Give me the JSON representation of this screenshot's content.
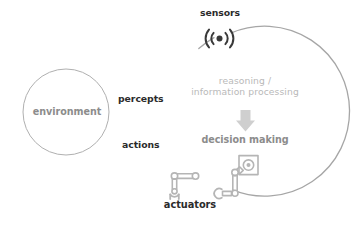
{
  "diagram": {
    "background_color": "#ffffff",
    "labels": {
      "environment": "environment",
      "percepts": "percepts",
      "actions": "actions",
      "sensors": "sensors",
      "actuators": "actuators",
      "reasoning_line1": "reasoning /",
      "reasoning_line2": "information processing",
      "decision_making": "decision making"
    },
    "icons": {
      "sensor": "wireless-broadcast-icon",
      "actuator_left": "robot-arm-gripper-icon",
      "actuator_right": "robot-arm-square-effector-icon",
      "flow": "down-arrow-icon"
    },
    "colors": {
      "dark_text": "#2b2b2b",
      "gray_text": "#8c8c8c",
      "light_text": "#b9b9b9",
      "circle_stroke": "#a6a6a6",
      "env_circle_stroke": "#b0b0b0",
      "arrow_fill": "#cfcfcf",
      "robot_stroke": "#b5b5b5"
    },
    "shapes": {
      "environment_circle": {
        "cx": 66,
        "cy": 112,
        "r": 43
      },
      "agent_circle": {
        "cx": 258,
        "cy": 111,
        "r": 85
      }
    }
  }
}
